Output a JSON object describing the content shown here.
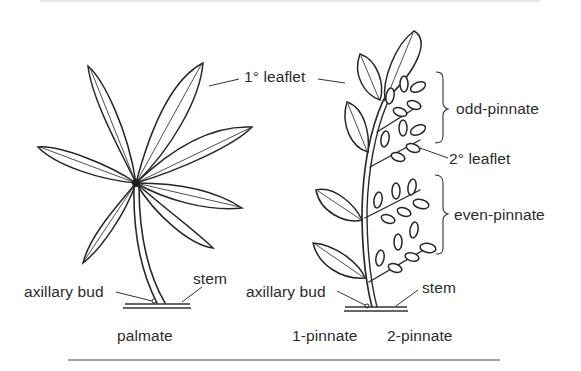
{
  "figure": {
    "type": "botanical-leaf-arrangement-diagram",
    "colors": {
      "ink": "#2a2a2a",
      "background": "#ffffff"
    },
    "labels": {
      "primary_leaflet": "1° leaflet",
      "secondary_leaflet": "2° leaflet",
      "odd_pinnate": "odd-pinnate",
      "even_pinnate": "even-pinnate",
      "axillary_bud_left": "axillary bud",
      "stem_left": "stem",
      "axillary_bud_right": "axillary bud",
      "stem_right": "stem"
    },
    "captions": {
      "palmate": "palmate",
      "one_pinnate": "1-pinnate",
      "two_pinnate": "2-pinnate"
    },
    "panels": [
      {
        "name": "palmate",
        "leaflet_count": 8
      },
      {
        "name": "pinnate",
        "primary_leaflets": 6,
        "secondary_groups": 4
      }
    ]
  }
}
